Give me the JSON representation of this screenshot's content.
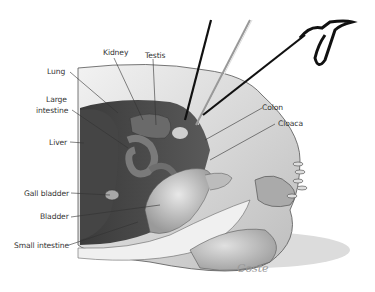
{
  "figure": {
    "labels": [
      {
        "id": "kidney",
        "text": "Kidney"
      },
      {
        "id": "testis",
        "text": "Testis"
      },
      {
        "id": "lung",
        "text": "Lung"
      },
      {
        "id": "large_intestine_1",
        "text": "Large"
      },
      {
        "id": "large_intestine_2",
        "text": "intestine"
      },
      {
        "id": "liver",
        "text": "Liver"
      },
      {
        "id": "colon",
        "text": "Colon"
      },
      {
        "id": "cloaca",
        "text": "Cloaca"
      },
      {
        "id": "gall_bladder",
        "text": "Gall bladder"
      },
      {
        "id": "bladder",
        "text": "Bladder"
      },
      {
        "id": "small_intestine",
        "text": "Small intestine"
      }
    ],
    "signature": "Coste"
  }
}
